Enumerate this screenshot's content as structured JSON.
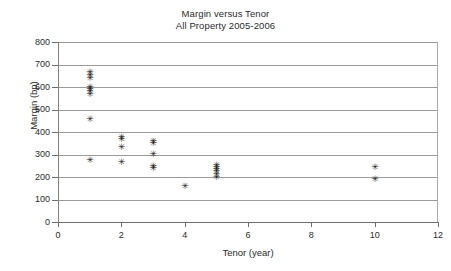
{
  "chart_data": {
    "type": "scatter",
    "title": "Margin versus Tenor",
    "subtitle": "All Property 2005-2006",
    "xlabel": "Tenor (year)",
    "ylabel": "Margin (bp)",
    "xlim": [
      0,
      12
    ],
    "ylim": [
      0,
      800
    ],
    "xticks": [
      0,
      2,
      4,
      6,
      8,
      10,
      12
    ],
    "yticks": [
      0,
      100,
      200,
      300,
      400,
      500,
      600,
      700,
      800
    ],
    "grid": "horizontal",
    "legend": "none",
    "marker": "asterisk",
    "marker_glyph": "✳",
    "marker_color": "#1d1d1d",
    "grid_color": "#9a9a9a",
    "axis_color": "#6e6e6e",
    "series": [
      {
        "name": "All Property 2005-2006",
        "points": [
          {
            "x": 1,
            "y": 665
          },
          {
            "x": 1,
            "y": 650
          },
          {
            "x": 1,
            "y": 640
          },
          {
            "x": 1,
            "y": 600
          },
          {
            "x": 1,
            "y": 588
          },
          {
            "x": 1,
            "y": 578
          },
          {
            "x": 1,
            "y": 568
          },
          {
            "x": 1,
            "y": 455
          },
          {
            "x": 1,
            "y": 273
          },
          {
            "x": 2,
            "y": 377
          },
          {
            "x": 2,
            "y": 368
          },
          {
            "x": 2,
            "y": 330
          },
          {
            "x": 2,
            "y": 265
          },
          {
            "x": 3,
            "y": 357
          },
          {
            "x": 3,
            "y": 348
          },
          {
            "x": 3,
            "y": 300
          },
          {
            "x": 3,
            "y": 246
          },
          {
            "x": 3,
            "y": 238
          },
          {
            "x": 4,
            "y": 156
          },
          {
            "x": 5,
            "y": 250
          },
          {
            "x": 5,
            "y": 241
          },
          {
            "x": 5,
            "y": 232
          },
          {
            "x": 5,
            "y": 223
          },
          {
            "x": 5,
            "y": 210
          },
          {
            "x": 5,
            "y": 197
          },
          {
            "x": 10,
            "y": 241
          },
          {
            "x": 10,
            "y": 190
          }
        ]
      }
    ]
  }
}
